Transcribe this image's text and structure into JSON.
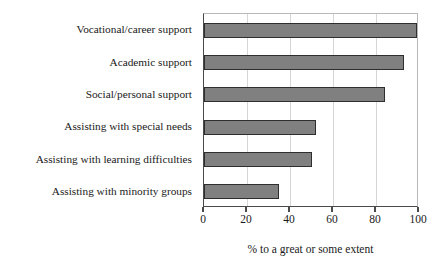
{
  "chart_data": {
    "type": "bar",
    "orientation": "horizontal",
    "title": "",
    "subtitle": "",
    "xlabel": "% to a great or some extent",
    "ylabel": "",
    "xlim": [
      0,
      100
    ],
    "xticks": [
      0,
      20,
      40,
      60,
      80,
      100
    ],
    "xtick_labels": [
      "0",
      "20",
      "40",
      "60",
      "80",
      "100"
    ],
    "grid": true,
    "grid_axis": "x",
    "legend": false,
    "legend_position": "none",
    "bar_color": "#808080",
    "bar_edge_color": "#2e2e2e",
    "background_color": "#ffffff",
    "categories": [
      "Vocational/career support",
      "Academic support",
      "Social/personal support",
      "Assisting with special needs",
      "Assisting with learning difficulties",
      "Assisting with minority groups"
    ],
    "values": [
      99,
      93,
      84,
      52,
      50,
      35
    ]
  }
}
